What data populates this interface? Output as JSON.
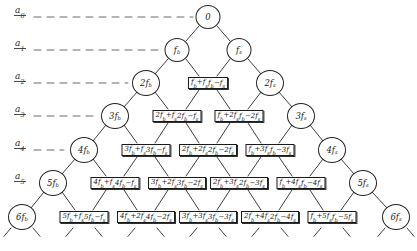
{
  "figure": {
    "type": "combination-frequency-tree",
    "width": 417,
    "height": 251,
    "ink_color": "#1c1c1c",
    "dash_color": "#6b6b6b"
  },
  "levels": [
    {
      "id": "a0",
      "label": "a",
      "sub": "0",
      "y": 17,
      "line_end": 193
    },
    {
      "id": "a1",
      "label": "a",
      "sub": "1",
      "y": 50,
      "line_end": 160
    },
    {
      "id": "a2",
      "label": "a",
      "sub": "2",
      "y": 83,
      "line_end": 128
    },
    {
      "id": "a3",
      "label": "a",
      "sub": "3",
      "y": 116,
      "line_end": 96
    },
    {
      "id": "a4",
      "label": "a",
      "sub": "4",
      "y": 150,
      "line_end": 64
    },
    {
      "id": "a5",
      "label": "a",
      "sub": "5",
      "y": 183,
      "line_end": 32
    },
    {
      "id": "a6",
      "label": "a",
      "sub": "6",
      "y": 217,
      "line_end": 0
    }
  ],
  "rows": [
    {
      "level": "a0",
      "y": 17,
      "nodes": [
        {
          "kind": "circle",
          "x": 208,
          "text": "0"
        }
      ]
    },
    {
      "level": "a1",
      "y": 50,
      "nodes": [
        {
          "kind": "circle",
          "x": 177,
          "text": "f",
          "sub": "b"
        },
        {
          "kind": "circle",
          "x": 239,
          "text": "f",
          "sub": "s"
        }
      ]
    },
    {
      "level": "a2",
      "y": 83,
      "nodes": [
        {
          "kind": "circle",
          "x": 146,
          "text": "2f",
          "sub": "b"
        },
        {
          "kind": "box",
          "x": 208,
          "line1": "f_b+f_s",
          "line2": "f_b−f_s"
        },
        {
          "kind": "circle",
          "x": 270,
          "text": "2f",
          "sub": "s"
        }
      ]
    },
    {
      "level": "a3",
      "y": 116,
      "nodes": [
        {
          "kind": "circle",
          "x": 115,
          "text": "3f",
          "sub": "b"
        },
        {
          "kind": "box",
          "x": 177,
          "line1": "2f_b+f_s",
          "line2": "2f_b−f_s"
        },
        {
          "kind": "box",
          "x": 239,
          "line1": "f_b+2f_s",
          "line2": "f_b−2f_s"
        },
        {
          "kind": "circle",
          "x": 301,
          "text": "3f",
          "sub": "s"
        }
      ]
    },
    {
      "level": "a4",
      "y": 150,
      "nodes": [
        {
          "kind": "circle",
          "x": 84,
          "text": "4f",
          "sub": "b"
        },
        {
          "kind": "box",
          "x": 146,
          "line1": "3f_b+f_s",
          "line2": "3f_b−f_s"
        },
        {
          "kind": "box",
          "x": 208,
          "line1": "2f_b+2f_s",
          "line2": "2f_b−2f_s"
        },
        {
          "kind": "box",
          "x": 270,
          "line1": "f_b+3f_s",
          "line2": "f_b−3f_s"
        },
        {
          "kind": "circle",
          "x": 332,
          "text": "4f",
          "sub": "s"
        }
      ]
    },
    {
      "level": "a5",
      "y": 183,
      "nodes": [
        {
          "kind": "circle",
          "x": 53,
          "text": "5f",
          "sub": "b"
        },
        {
          "kind": "box",
          "x": 115,
          "line1": "4f_b+f_s",
          "line2": "4f_b−f_s"
        },
        {
          "kind": "box",
          "x": 177,
          "line1": "3f_b+2f_s",
          "line2": "3f_b−2f_s"
        },
        {
          "kind": "box",
          "x": 239,
          "line1": "2f_b+3f_s",
          "line2": "2f_b−3f_s"
        },
        {
          "kind": "box",
          "x": 301,
          "line1": "f_b+4f_s",
          "line2": "f_b−4f_s"
        },
        {
          "kind": "circle",
          "x": 363,
          "text": "5f",
          "sub": "s"
        }
      ]
    },
    {
      "level": "a6",
      "y": 217,
      "nodes": [
        {
          "kind": "circle",
          "x": 22,
          "text": "6f",
          "sub": "b"
        },
        {
          "kind": "box",
          "x": 84,
          "line1": "5f_b+f_s",
          "line2": "5f_b−f_s"
        },
        {
          "kind": "box",
          "x": 146,
          "line1": "4f_b+2f_s",
          "line2": "4f_b−2f_s"
        },
        {
          "kind": "box",
          "x": 208,
          "line1": "3f_b+3f_s",
          "line2": "3f_b−3f_s"
        },
        {
          "kind": "box",
          "x": 270,
          "line1": "2f_b+4f_s",
          "line2": "2f_b−4f_s"
        },
        {
          "kind": "box",
          "x": 332,
          "line1": "f_b+5f_s",
          "line2": "f_b−5f_s"
        },
        {
          "kind": "circle",
          "x": 396,
          "text": "6f",
          "sub": "s"
        }
      ]
    }
  ],
  "continuation": {
    "note": "short dashed diagonals below bottom row indicating the tree continues",
    "count": 13
  }
}
